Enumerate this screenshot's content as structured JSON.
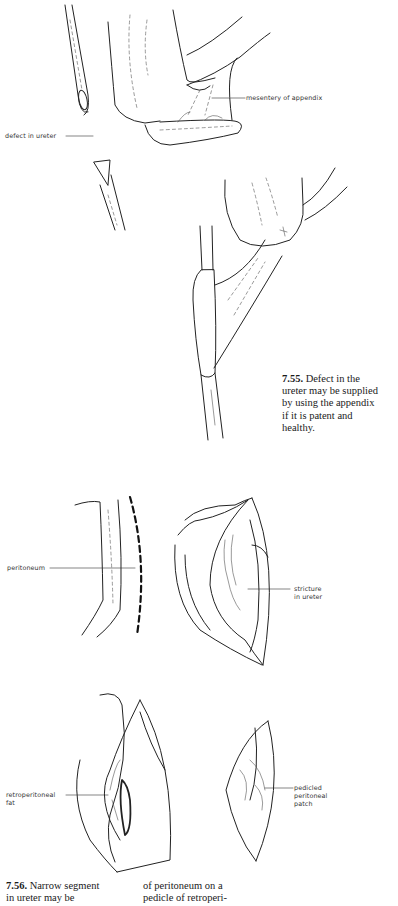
{
  "figure_7_55": {
    "labels": {
      "mesentery": "mesentery of appendix",
      "defect": "defect in ureter"
    },
    "caption": {
      "number": "7.55.",
      "lines": [
        " Defect in the",
        "ureter may be supplied",
        "by using the appendix",
        "if it is patent and",
        "healthy."
      ]
    }
  },
  "figure_7_56": {
    "labels": {
      "peritoneum": "peritoneum",
      "stricture_line1": "stricture",
      "stricture_line2": "in ureter",
      "retro_line1": "retroperitoneal",
      "retro_line2": "fat",
      "pedicled_line1": "pedicled",
      "pedicled_line2": "peritoneal",
      "pedicled_line3": "patch"
    },
    "caption": {
      "number": "7.56.",
      "col1_lines": [
        " Narrow segment",
        "in ureter may be"
      ],
      "col2_lines": [
        "of peritoneum on a",
        "pedicle of retroperi-"
      ]
    }
  }
}
